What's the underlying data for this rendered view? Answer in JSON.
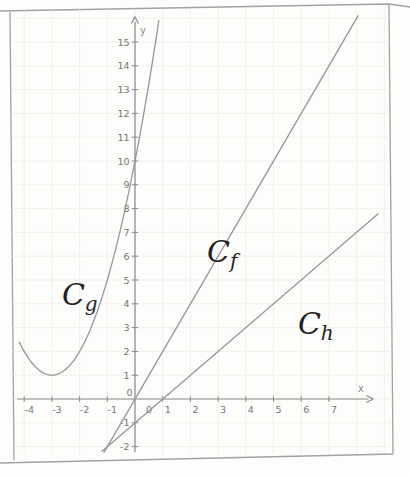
{
  "figure": {
    "kind": "scanned-math-figure",
    "background": "#fdfdfc",
    "frame_color": "#a2a2a2"
  },
  "chart_data": {
    "type": "line",
    "title": "",
    "grid": true,
    "legend": "none",
    "axes": {
      "x_label": "x",
      "y_label": "y",
      "x_ticks": [
        -4,
        -3,
        -2,
        -1,
        1,
        2,
        3,
        4,
        5,
        6,
        7
      ],
      "y_ticks": [
        15,
        14,
        13,
        12,
        11,
        10,
        9,
        8,
        7,
        6,
        5,
        4,
        3,
        2,
        1,
        -1,
        -2
      ],
      "origin_x_label": "0",
      "origin_y_label": "0",
      "xlim": [
        -4.45,
        9.2
      ],
      "ylim": [
        -2.3,
        16.4
      ],
      "grid_x_range": [
        -4,
        9
      ],
      "grid_y_range": [
        -2,
        16
      ]
    },
    "series": [
      {
        "name": "Cf",
        "label": "C",
        "subscript": "f",
        "kind": "linear",
        "slope": 2,
        "intercept": 0,
        "x_start": -1.12,
        "x_end": 8.05,
        "label_pos": [
          2.6,
          5.76
        ]
      },
      {
        "name": "Cg",
        "label": "C",
        "subscript": "g",
        "kind": "parabola",
        "a": 1,
        "vertex": [
          -3,
          1
        ],
        "y_intercept": 10,
        "x_start": -4.18,
        "x_end": 0.88,
        "label_pos": [
          -2.64,
          3.95
        ]
      },
      {
        "name": "Ch",
        "label": "C",
        "subscript": "h",
        "kind": "linear",
        "slope": 1,
        "intercept": -1,
        "x_start": -1.2,
        "x_end": 8.78,
        "label_pos": [
          5.88,
          2.73
        ]
      }
    ],
    "key_points": {
      "f_h_intersection": [
        -1,
        -2
      ],
      "g_vertex": [
        -3,
        1
      ],
      "g_y_intercept": [
        0,
        10
      ],
      "h_x_intercept": [
        1,
        0
      ]
    },
    "colors": {
      "curve": "#979797",
      "axis": "#8a8a8a",
      "tick_text": "#767676",
      "grid": "#eae6e1",
      "curve_label": "#222222"
    }
  }
}
